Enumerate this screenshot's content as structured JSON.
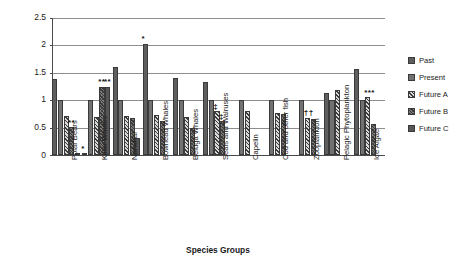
{
  "chart_data": {
    "type": "bar",
    "title": "",
    "xlabel": "Species Groups",
    "ylabel": "Biomass Relative to Current Ecosystem",
    "ylim": [
      0,
      2.5
    ],
    "yticks": [
      "0",
      "0.5",
      "1",
      "1.5",
      "2",
      "2.5"
    ],
    "grid": true,
    "legend_position": "right",
    "categories": [
      "Polar Bears",
      "Killer Whales",
      "Narwhal",
      "Bowhead Whales",
      "Beluga Whales",
      "Seals and Walruses",
      "Capelin",
      "Cod and other fish",
      "Zooplankton",
      "Pelagic Phytoplankton",
      "Ice Algae"
    ],
    "series": [
      {
        "name": "Past",
        "color": "#5e5e5e",
        "values": [
          1.38,
          0.03,
          1.6,
          2.03,
          1.41,
          1.34,
          0.0,
          0.0,
          0.0,
          1.13,
          1.57
        ]
      },
      {
        "name": "Present",
        "color": "#717171",
        "values": [
          1.0,
          1.0,
          1.0,
          1.0,
          1.0,
          1.0,
          1.0,
          1.0,
          1.0,
          1.0,
          1.0
        ]
      },
      {
        "name": "Future A",
        "color": "#8a8a8a",
        "values": [
          0.72,
          0.7,
          0.71,
          0.73,
          0.7,
          0.8,
          0.81,
          0.76,
          0.68,
          1.18,
          1.05
        ]
      },
      {
        "name": "Future B",
        "color": "#7d7d7d",
        "values": [
          0.51,
          1.25,
          0.68,
          0.62,
          0.49,
          0.62,
          0.0,
          0.74,
          0.65,
          0.0,
          0.56
        ]
      },
      {
        "name": "Future C",
        "color": "#565656",
        "values": [
          0.02,
          1.25,
          0.31,
          0.0,
          0.0,
          0.0,
          0.0,
          0.0,
          0.0,
          0.0,
          0.0
        ]
      }
    ],
    "annotations": [
      {
        "text": "**",
        "category": "Polar Bears",
        "series": "Future B",
        "value": 0.51
      },
      {
        "text": "*",
        "category": "Killer Whales",
        "series": "Past",
        "value": 0.03
      },
      {
        "text": "**",
        "category": "Killer Whales",
        "series": "Future B",
        "value": 1.25
      },
      {
        "text": "**",
        "category": "Killer Whales",
        "series": "Future C",
        "value": 1.25
      },
      {
        "text": "*",
        "category": "Bowhead Whales",
        "series": "Past",
        "value": 2.03
      },
      {
        "text": "‡",
        "category": "Seals and Walruses",
        "series": "Future A",
        "value": 0.8
      },
      {
        "text": "‡",
        "category": "Seals and Walruses",
        "series": "Future B",
        "value": 0.62
      },
      {
        "text": "††",
        "category": "Zooplankton",
        "series": "Future A",
        "value": 0.68
      },
      {
        "text": "***",
        "category": "Ice Algae",
        "series": "Future A",
        "value": 1.05
      }
    ]
  },
  "legend": {
    "items": [
      {
        "label": "Past"
      },
      {
        "label": "Present"
      },
      {
        "label": "Future A"
      },
      {
        "label": "Future B"
      },
      {
        "label": "Future C"
      }
    ]
  }
}
